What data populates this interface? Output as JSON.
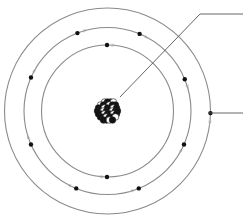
{
  "diagram": {
    "type": "bohr-atom-model",
    "center": [
      107.5,
      111
    ],
    "colors": {
      "orbit": "#8a8a8a",
      "electron": "#111111",
      "leader_line": "#555555",
      "proton": "#111111",
      "neutron": "#ffffff"
    },
    "orbits": [
      {
        "name": "inner-shell",
        "radius": 66,
        "electrons": [
          [
            107,
            44
          ],
          [
            107,
            177
          ]
        ]
      },
      {
        "name": "middle-shell",
        "radius": 83.5,
        "electrons": [
          [
            77,
            32
          ],
          [
            140,
            33
          ],
          [
            32,
            78
          ],
          [
            183,
            80
          ],
          [
            32,
            144
          ],
          [
            183,
            144
          ],
          [
            76,
            189
          ],
          [
            139,
            189
          ]
        ]
      },
      {
        "name": "outer-shell",
        "radius": 103,
        "electrons": [
          [
            206,
            113
          ]
        ]
      }
    ],
    "labels": [
      {
        "name": "nucleus-label-line",
        "points": [
          [
            120,
            97
          ],
          [
            200,
            14
          ],
          [
            243,
            14
          ]
        ],
        "text": ""
      },
      {
        "name": "electron-label-line",
        "points": [
          [
            208,
            113
          ],
          [
            243,
            113
          ]
        ],
        "text": ""
      }
    ]
  }
}
